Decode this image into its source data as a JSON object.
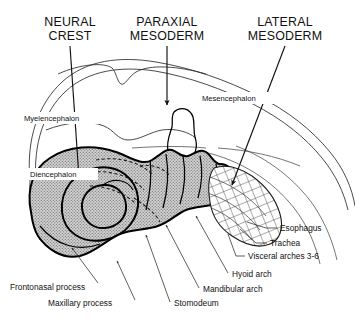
{
  "figure": {
    "width": 355,
    "height": 321,
    "background_color": "#ffffff",
    "ink_color": "#111111",
    "stipple_fill_color": "#b8b8b8",
    "crosshatch_color": "#4a4a4a"
  },
  "headers": [
    {
      "id": "neural-crest",
      "line1": "NEURAL",
      "line2": "CREST"
    },
    {
      "id": "paraxial-mesoderm",
      "line1": "PARAXIAL",
      "line2": "MESODERM"
    },
    {
      "id": "lateral-mesoderm",
      "line1": "LATERAL",
      "line2": "MESODERM"
    }
  ],
  "internal_labels": [
    {
      "id": "myelencephalon",
      "text": "Myelencephalon"
    },
    {
      "id": "mesencephalon",
      "text": "Mesencephalon"
    },
    {
      "id": "diencephalon",
      "text": "Diencephalon"
    }
  ],
  "right_labels": [
    {
      "id": "esophagus",
      "text": "Esophagus"
    },
    {
      "id": "trachea",
      "text": "Trachea"
    },
    {
      "id": "visceral-arches",
      "text": "Visceral arches 3-6"
    }
  ],
  "bottom_labels": [
    {
      "id": "frontonasal-process",
      "text": "Frontonasal process"
    },
    {
      "id": "maxillary-process",
      "text": "Maxillary process"
    },
    {
      "id": "stomodeum",
      "text": "Stomodeum"
    },
    {
      "id": "mandibular-arch",
      "text": "Mandibular arch"
    },
    {
      "id": "hyoid-arch",
      "text": "Hyoid arch"
    }
  ]
}
